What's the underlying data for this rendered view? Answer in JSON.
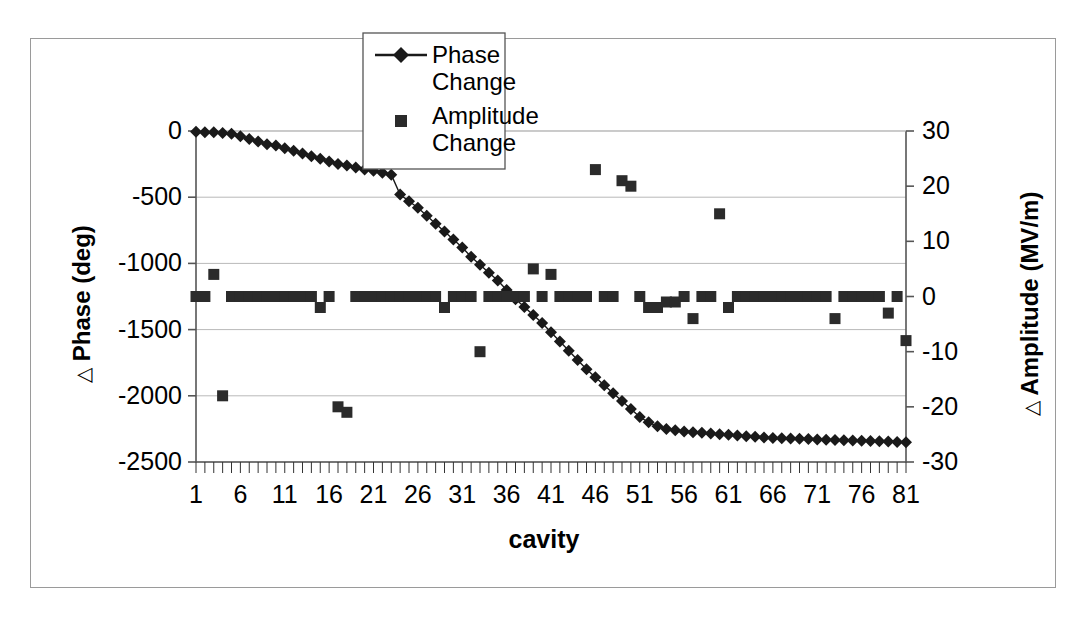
{
  "chart_data": {
    "type": "scatter",
    "title": "",
    "xlabel": "cavity",
    "ylabel": "Δ Phase (deg)",
    "ylabel_right": "Δ Amplitude (MV/m)",
    "xlim": [
      1,
      81
    ],
    "ylim": [
      -2500,
      0
    ],
    "ylim_right": [
      -30,
      30
    ],
    "xticks": [
      1,
      6,
      11,
      16,
      21,
      26,
      31,
      36,
      41,
      46,
      51,
      56,
      61,
      66,
      71,
      76,
      81
    ],
    "xtick_labels": [
      "1",
      "6",
      "11",
      "16",
      "21",
      "26",
      "31",
      "36",
      "41",
      "46",
      "51",
      "56",
      "61",
      "66",
      "71",
      "76",
      "81"
    ],
    "yticks": [
      0,
      -500,
      -1000,
      -1500,
      -2000,
      -2500
    ],
    "ytick_labels": [
      "0",
      "-500",
      "-1000",
      "-1500",
      "-2000",
      "-2500"
    ],
    "yticks_right": [
      30,
      20,
      10,
      0,
      -10,
      -20,
      -30
    ],
    "ytick_labels_right": [
      "30",
      "20",
      "10",
      "0",
      "-10",
      "-20",
      "-30"
    ],
    "grid": true,
    "grid_axis": "y",
    "legend_position": "top-center",
    "series": [
      {
        "name": "Phase Change",
        "marker": "diamond",
        "line": true,
        "color": "#1a1a1a",
        "axis": "left",
        "x": [
          1,
          2,
          3,
          4,
          5,
          6,
          7,
          8,
          9,
          10,
          11,
          12,
          13,
          14,
          15,
          16,
          17,
          18,
          19,
          20,
          21,
          22,
          23,
          24,
          25,
          26,
          27,
          28,
          29,
          30,
          31,
          32,
          33,
          34,
          35,
          36,
          37,
          38,
          39,
          40,
          41,
          42,
          43,
          44,
          45,
          46,
          47,
          48,
          49,
          50,
          51,
          52,
          53,
          54,
          55,
          56,
          57,
          58,
          59,
          60,
          61,
          62,
          63,
          64,
          65,
          66,
          67,
          68,
          69,
          70,
          71,
          72,
          73,
          74,
          75,
          76,
          77,
          78,
          79,
          80,
          81
        ],
        "values": [
          -5,
          -10,
          -10,
          -15,
          -20,
          -40,
          -60,
          -80,
          -100,
          -110,
          -130,
          -150,
          -170,
          -190,
          -210,
          -230,
          -250,
          -260,
          -275,
          -290,
          -300,
          -315,
          -330,
          -480,
          -530,
          -580,
          -640,
          -700,
          -760,
          -820,
          -880,
          -950,
          -1010,
          -1070,
          -1130,
          -1200,
          -1270,
          -1330,
          -1390,
          -1450,
          -1520,
          -1590,
          -1660,
          -1730,
          -1800,
          -1860,
          -1920,
          -1980,
          -2040,
          -2100,
          -2160,
          -2200,
          -2230,
          -2250,
          -2260,
          -2270,
          -2275,
          -2280,
          -2285,
          -2290,
          -2295,
          -2300,
          -2305,
          -2310,
          -2315,
          -2318,
          -2320,
          -2322,
          -2325,
          -2327,
          -2330,
          -2332,
          -2334,
          -2336,
          -2338,
          -2340,
          -2342,
          -2344,
          -2346,
          -2348,
          -2350
        ]
      },
      {
        "name": "Amplitude Change",
        "marker": "square",
        "line": false,
        "color": "#2b2b2b",
        "axis": "right",
        "x": [
          1,
          2,
          3,
          4,
          5,
          6,
          7,
          8,
          9,
          10,
          11,
          12,
          13,
          14,
          15,
          16,
          17,
          18,
          19,
          20,
          21,
          22,
          23,
          24,
          25,
          26,
          27,
          28,
          29,
          30,
          31,
          32,
          33,
          34,
          35,
          36,
          37,
          38,
          39,
          40,
          41,
          42,
          43,
          44,
          45,
          46,
          47,
          48,
          49,
          50,
          51,
          52,
          53,
          54,
          55,
          56,
          57,
          58,
          59,
          60,
          61,
          62,
          63,
          64,
          65,
          66,
          67,
          68,
          69,
          70,
          71,
          72,
          73,
          74,
          75,
          76,
          77,
          78,
          79,
          80,
          81
        ],
        "values": [
          0,
          0,
          4,
          -18,
          0,
          0,
          0,
          0,
          0,
          0,
          0,
          0,
          0,
          0,
          -2,
          0,
          -20,
          -21,
          0,
          0,
          0,
          0,
          0,
          0,
          0,
          0,
          0,
          0,
          -2,
          0,
          0,
          0,
          -10,
          0,
          0,
          0,
          0,
          0,
          5,
          0,
          4,
          0,
          0,
          0,
          0,
          23,
          0,
          0,
          21,
          20,
          0,
          -2,
          -2,
          -1,
          -1,
          0,
          -4,
          0,
          0,
          15,
          -2,
          0,
          0,
          0,
          0,
          0,
          0,
          0,
          0,
          0,
          0,
          0,
          -4,
          0,
          0,
          0,
          0,
          0,
          -3,
          0,
          -8
        ]
      }
    ]
  },
  "legend": {
    "entries": [
      {
        "label_line1": "Phase",
        "label_line2": "Change",
        "marker": "diamond-with-line"
      },
      {
        "label_line1": "Amplitude",
        "label_line2": "Change",
        "marker": "square"
      }
    ]
  },
  "axes": {
    "left_title_delta": "△",
    "left_title_text": "Phase (deg)",
    "right_title_delta": "△",
    "right_title_text": "Amplitude (MV/m)",
    "x_title": "cavity"
  },
  "colors": {
    "frame": "#9a9a9a",
    "axis": "#555555",
    "grid": "#b9b9b9",
    "series_phase": "#1a1a1a",
    "series_amplitude": "#2b2b2b",
    "background": "#ffffff"
  }
}
